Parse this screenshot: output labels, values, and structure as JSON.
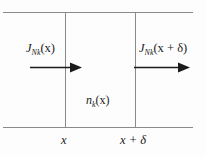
{
  "figure": {
    "name": "particle-flux-slab-diagram",
    "line_color": "#8a8a8a",
    "text_color": "#1b1b1b",
    "background": "#fdfdfd"
  },
  "labels": {
    "flux_in": {
      "symbol": "J",
      "subscript": "Nk",
      "argument": "(x)",
      "full": "J_Nk(x)"
    },
    "flux_out": {
      "symbol": "J",
      "subscript": "Nk",
      "argument": "(x + δ)",
      "full": "J_Nk(x + δ)"
    },
    "density": {
      "symbol": "n",
      "subscript": "k",
      "argument": "(x)",
      "full": "n_k(x)"
    },
    "axis_left": "x",
    "axis_right": "x + δ"
  },
  "arrows": {
    "incoming": {
      "name": "flux-in-arrow",
      "direction": "right"
    },
    "outgoing": {
      "name": "flux-out-arrow",
      "direction": "right"
    }
  }
}
